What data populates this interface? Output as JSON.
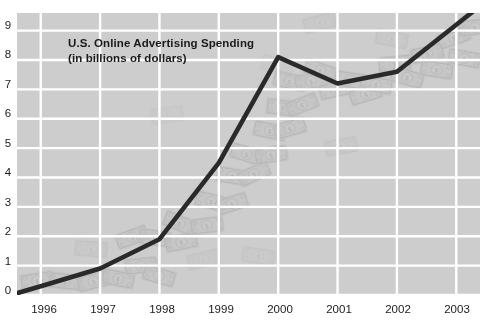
{
  "chart_data": {
    "type": "line",
    "title": "U.S. Online Advertising Spending",
    "subtitle": "(in billions of dollars)",
    "xlabel": "",
    "ylabel": "",
    "categories": [
      "1996",
      "1997",
      "1998",
      "1999",
      "2000",
      "2001",
      "2002",
      "2003"
    ],
    "x": [
      1996,
      1997,
      1998,
      1999,
      2000,
      2001,
      2002,
      2003
    ],
    "values": [
      0.3,
      0.9,
      1.9,
      4.5,
      8.1,
      7.2,
      7.6,
      9.2
    ],
    "series": [
      {
        "name": "U.S. Online Advertising Spending",
        "values": [
          0.3,
          0.9,
          1.9,
          4.5,
          8.1,
          7.2,
          7.6,
          9.2
        ]
      }
    ],
    "yticks": [
      0,
      1,
      2,
      3,
      4,
      5,
      6,
      7,
      8,
      9
    ],
    "ylim": [
      0,
      9.6
    ],
    "xlim": [
      1995.6,
      2003.4
    ],
    "grid": true,
    "legend": false,
    "line_color": "#2a2a2a",
    "panel_color": "#cdcdcd",
    "grid_color": "#ffffff",
    "background_motif": "dollar-bills-watermark"
  },
  "axes": {
    "y_tick_labels": [
      "9",
      "8",
      "7",
      "6",
      "5",
      "4",
      "3",
      "2",
      "1",
      "0"
    ],
    "x_tick_labels": [
      "1996",
      "1997",
      "1998",
      "1999",
      "2000",
      "2001",
      "2002",
      "2003"
    ]
  }
}
